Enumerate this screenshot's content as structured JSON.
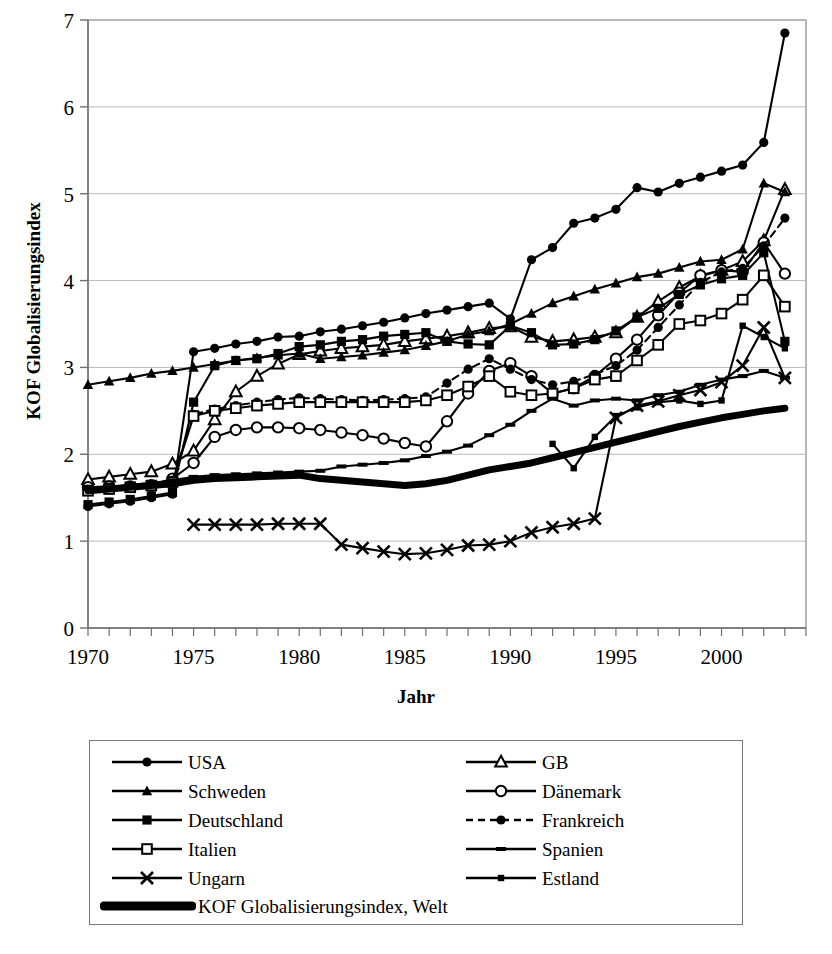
{
  "chart_data": {
    "type": "line",
    "title": "",
    "xlabel": "Jahr",
    "ylabel": "KOF Globalisierungsindex",
    "xlim": [
      1970,
      2004
    ],
    "ylim": [
      0,
      7
    ],
    "yticks": [
      0,
      1,
      2,
      3,
      4,
      5,
      6,
      7
    ],
    "xticks_labeled": [
      1970,
      1975,
      1980,
      1985,
      1990,
      1995,
      2000
    ],
    "xtick_step": 1,
    "grid": "horizontal",
    "legend_position": "below-plot",
    "x": [
      1970,
      1971,
      1972,
      1973,
      1974,
      1975,
      1976,
      1977,
      1978,
      1979,
      1980,
      1981,
      1982,
      1983,
      1984,
      1985,
      1986,
      1987,
      1988,
      1989,
      1990,
      1991,
      1992,
      1993,
      1994,
      1995,
      1996,
      1997,
      1998,
      1999,
      2000,
      2001,
      2002,
      2003
    ],
    "series": [
      {
        "name": "USA",
        "marker": "filled-circle",
        "line": "solid",
        "values": [
          1.4,
          1.43,
          1.46,
          1.5,
          1.54,
          3.18,
          3.22,
          3.27,
          3.3,
          3.35,
          3.36,
          3.41,
          3.44,
          3.48,
          3.52,
          3.57,
          3.62,
          3.66,
          3.7,
          3.74,
          3.56,
          4.24,
          4.38,
          4.66,
          4.72,
          4.82,
          5.07,
          5.02,
          5.12,
          5.19,
          5.26,
          5.33,
          5.59,
          6.85
        ]
      },
      {
        "name": "GB",
        "marker": "open-triangle",
        "line": "solid",
        "values": [
          1.71,
          1.74,
          1.77,
          1.8,
          1.89,
          2.04,
          2.4,
          2.72,
          2.9,
          3.04,
          3.15,
          3.19,
          3.22,
          3.24,
          3.26,
          3.3,
          3.33,
          3.36,
          3.4,
          3.45,
          3.47,
          3.35,
          3.3,
          3.32,
          3.35,
          3.4,
          3.58,
          3.76,
          3.92,
          4.05,
          4.12,
          4.22,
          4.46,
          5.05
        ]
      },
      {
        "name": "Schweden",
        "marker": "filled-triangle",
        "line": "solid",
        "values": [
          2.8,
          2.84,
          2.88,
          2.93,
          2.96,
          3.0,
          3.04,
          3.08,
          3.11,
          3.14,
          3.16,
          3.1,
          3.12,
          3.14,
          3.17,
          3.2,
          3.25,
          3.3,
          3.38,
          3.42,
          3.5,
          3.62,
          3.74,
          3.82,
          3.9,
          3.97,
          4.04,
          4.08,
          4.15,
          4.22,
          4.24,
          4.36,
          5.12,
          5.02
        ]
      },
      {
        "name": "Dänemark",
        "marker": "open-circle",
        "line": "solid",
        "values": [
          1.62,
          1.63,
          1.63,
          1.64,
          1.72,
          1.9,
          2.2,
          2.28,
          2.31,
          2.31,
          2.3,
          2.28,
          2.25,
          2.22,
          2.18,
          2.13,
          2.09,
          2.38,
          2.7,
          2.96,
          3.05,
          2.9,
          2.7,
          2.76,
          2.9,
          3.1,
          3.32,
          3.6,
          3.86,
          4.06,
          4.12,
          4.1,
          4.44,
          4.08
        ]
      },
      {
        "name": "Deutschland",
        "marker": "filled-square",
        "line": "solid",
        "values": [
          1.42,
          1.45,
          1.48,
          1.52,
          1.56,
          2.6,
          3.02,
          3.08,
          3.1,
          3.16,
          3.24,
          3.26,
          3.3,
          3.32,
          3.36,
          3.38,
          3.4,
          3.3,
          3.27,
          3.26,
          3.48,
          3.4,
          3.26,
          3.27,
          3.32,
          3.42,
          3.58,
          3.68,
          3.84,
          3.95,
          4.02,
          4.06,
          4.32,
          3.3
        ]
      },
      {
        "name": "Frankreich",
        "marker": "filled-circle",
        "line": "dashed",
        "values": [
          1.6,
          1.62,
          1.64,
          1.66,
          1.7,
          2.46,
          2.52,
          2.56,
          2.6,
          2.63,
          2.65,
          2.64,
          2.63,
          2.62,
          2.63,
          2.64,
          2.66,
          2.82,
          2.98,
          3.1,
          2.98,
          2.86,
          2.8,
          2.84,
          2.92,
          3.02,
          3.2,
          3.46,
          3.72,
          3.98,
          4.1,
          4.14,
          4.4,
          4.72
        ]
      },
      {
        "name": "Italien",
        "marker": "open-square",
        "line": "solid",
        "values": [
          1.58,
          1.6,
          1.62,
          1.64,
          1.68,
          2.44,
          2.5,
          2.53,
          2.56,
          2.58,
          2.6,
          2.6,
          2.6,
          2.6,
          2.6,
          2.6,
          2.62,
          2.68,
          2.78,
          2.9,
          2.72,
          2.68,
          2.7,
          2.76,
          2.86,
          2.9,
          3.08,
          3.26,
          3.5,
          3.54,
          3.62,
          3.78,
          4.06,
          3.7
        ]
      },
      {
        "name": "Spanien",
        "marker": "small-dash",
        "line": "solid",
        "values": [
          1.6,
          1.62,
          1.65,
          1.67,
          1.7,
          1.74,
          1.76,
          1.77,
          1.78,
          1.79,
          1.8,
          1.81,
          1.86,
          1.88,
          1.9,
          1.93,
          1.98,
          2.03,
          2.1,
          2.22,
          2.34,
          2.5,
          2.64,
          2.56,
          2.62,
          2.64,
          2.62,
          2.68,
          2.72,
          2.8,
          2.86,
          2.9,
          2.96,
          2.88
        ]
      },
      {
        "name": "Ungarn",
        "marker": "cross-x",
        "line": "solid",
        "values": [
          null,
          null,
          null,
          null,
          null,
          1.19,
          1.19,
          1.19,
          1.19,
          1.2,
          1.2,
          1.2,
          0.96,
          0.92,
          0.88,
          0.85,
          0.86,
          0.9,
          0.95,
          0.96,
          1.0,
          1.1,
          1.16,
          1.2,
          1.26,
          2.42,
          2.56,
          2.61,
          2.68,
          2.74,
          2.83,
          3.02,
          3.46,
          2.88
        ]
      },
      {
        "name": "Estland",
        "marker": "small-square",
        "line": "solid",
        "values": [
          null,
          null,
          null,
          null,
          null,
          null,
          null,
          null,
          null,
          null,
          null,
          null,
          null,
          null,
          null,
          null,
          null,
          null,
          null,
          null,
          null,
          null,
          2.12,
          1.84,
          2.2,
          2.44,
          2.54,
          2.6,
          2.62,
          2.58,
          2.62,
          3.48,
          3.35,
          3.22
        ]
      },
      {
        "name": "KOF Globalisierungsindex, Welt",
        "marker": "none",
        "line": "thick",
        "values": [
          1.58,
          1.6,
          1.62,
          1.64,
          1.66,
          1.7,
          1.72,
          1.73,
          1.74,
          1.75,
          1.76,
          1.72,
          1.7,
          1.68,
          1.66,
          1.64,
          1.66,
          1.7,
          1.76,
          1.82,
          1.86,
          1.9,
          1.96,
          2.02,
          2.08,
          2.14,
          2.2,
          2.26,
          2.32,
          2.37,
          2.42,
          2.46,
          2.5,
          2.53
        ]
      }
    ]
  },
  "axes": {
    "y_tick_labels": [
      "0",
      "1",
      "2",
      "3",
      "4",
      "5",
      "6",
      "7"
    ],
    "x_tick_labels": [
      "1970",
      "1975",
      "1980",
      "1985",
      "1990",
      "1995",
      "2000"
    ],
    "x_axis_title": "Jahr",
    "y_axis_title": "KOF Globalisierungsindex"
  },
  "legend": {
    "column_left": [
      {
        "label": "USA",
        "marker": "filled-circle",
        "line": "solid"
      },
      {
        "label": "Schweden",
        "marker": "filled-triangle",
        "line": "solid"
      },
      {
        "label": "Deutschland",
        "marker": "filled-square",
        "line": "solid"
      },
      {
        "label": "Italien",
        "marker": "open-square",
        "line": "solid"
      },
      {
        "label": "Ungarn",
        "marker": "cross-x",
        "line": "solid"
      }
    ],
    "column_right": [
      {
        "label": "GB",
        "marker": "open-triangle",
        "line": "solid"
      },
      {
        "label": "Dänemark",
        "marker": "open-circle",
        "line": "solid"
      },
      {
        "label": "Frankreich",
        "marker": "filled-circle",
        "line": "dashed"
      },
      {
        "label": "Spanien",
        "marker": "small-dash",
        "line": "solid"
      },
      {
        "label": "Estland",
        "marker": "small-square",
        "line": "solid"
      }
    ],
    "bottom_row": {
      "label": "KOF Globalisierungsindex, Welt",
      "marker": "none",
      "line": "thick"
    }
  },
  "colors": {
    "foreground": "#000000",
    "background": "#ffffff",
    "gridline": "#b9b9b9",
    "axis": "#6f6f6f",
    "legend_border": "#7a7a7a"
  }
}
